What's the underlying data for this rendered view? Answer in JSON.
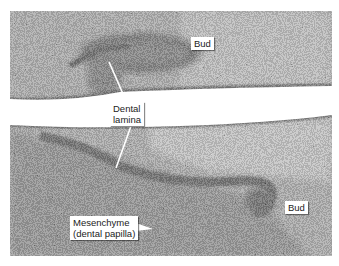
{
  "figure": {
    "labels": {
      "bud_upper": "Bud",
      "dental_lamina_line1": "Dental",
      "dental_lamina_line2": "lamina",
      "bud_lower": "Bud",
      "mesenchyme_line1": "Mesenchyme",
      "mesenchyme_line2": "(dental papilla)"
    }
  }
}
